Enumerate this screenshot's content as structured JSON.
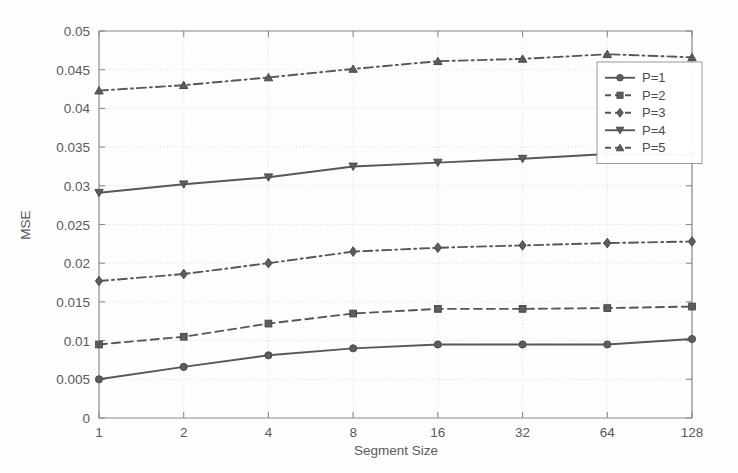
{
  "chart_data": {
    "type": "line",
    "title": "",
    "xlabel": "Segment Size",
    "ylabel": "MSE",
    "x": [
      1,
      2,
      4,
      8,
      16,
      32,
      64,
      128
    ],
    "x_tick_labels": [
      "1",
      "2",
      "4",
      "8",
      "16",
      "32",
      "64",
      "128"
    ],
    "x_scale": "log2",
    "xlim": [
      1,
      128
    ],
    "ylim": [
      0,
      0.05
    ],
    "y_ticks": [
      0,
      0.005,
      0.01,
      0.015,
      0.02,
      0.025,
      0.03,
      0.035,
      0.04,
      0.045,
      0.05
    ],
    "y_tick_labels": [
      "0",
      "0.005",
      "0.01",
      "0.015",
      "0.02",
      "0.025",
      "0.03",
      "0.035",
      "0.04",
      "0.045",
      "0.05"
    ],
    "grid": true,
    "legend_position": "upper right",
    "series": [
      {
        "name": "P=1",
        "values": [
          0.005,
          0.0066,
          0.0081,
          0.009,
          0.0095,
          0.0095,
          0.0095,
          0.0102
        ],
        "line_style": "solid",
        "marker": "circle",
        "color": "#575757"
      },
      {
        "name": "P=2",
        "values": [
          0.0095,
          0.0105,
          0.0122,
          0.0135,
          0.0141,
          0.0141,
          0.0142,
          0.0144
        ],
        "line_style": "dashed",
        "marker": "square",
        "color": "#575757"
      },
      {
        "name": "P=3",
        "values": [
          0.0177,
          0.0186,
          0.02,
          0.0215,
          0.022,
          0.0223,
          0.0226,
          0.0228
        ],
        "line_style": "dashdot",
        "marker": "diamond",
        "color": "#575757"
      },
      {
        "name": "P=4",
        "values": [
          0.0291,
          0.0302,
          0.0311,
          0.0325,
          0.033,
          0.0335,
          0.0341,
          0.034
        ],
        "line_style": "solid",
        "marker": "triangle-down",
        "color": "#575757"
      },
      {
        "name": "P=5",
        "values": [
          0.0423,
          0.043,
          0.044,
          0.0451,
          0.0461,
          0.0464,
          0.047,
          0.0466
        ],
        "line_style": "dashdot",
        "marker": "triangle-up",
        "color": "#575757"
      }
    ]
  },
  "legend": {
    "entries": [
      "P=1",
      "P=2",
      "P=3",
      "P=4",
      "P=5"
    ]
  },
  "colors": {
    "background": "#fdfdfd",
    "axis": "#8a8a8a",
    "grid": "#d8d8d8",
    "series": "#575757",
    "text": "#5a5a5a"
  }
}
